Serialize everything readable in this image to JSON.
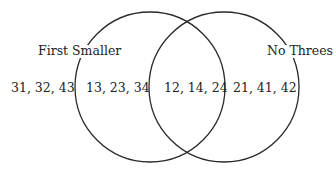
{
  "diagram": {
    "type": "venn",
    "sets": [
      {
        "label": "First Smaller"
      },
      {
        "label": "No Threes"
      }
    ],
    "regions": {
      "outside": "31, 32, 43",
      "first_only": "13, 23, 34",
      "both": "12, 14, 24",
      "second_only": "21, 41, 42"
    }
  }
}
